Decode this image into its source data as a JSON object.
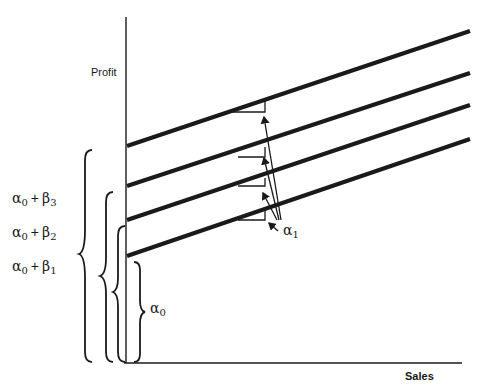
{
  "figure": {
    "x_axis_label": "Sales",
    "y_axis_label": "Profit",
    "colors": {
      "ink": "#1a1a1a",
      "background": "#ffffff"
    },
    "slope_label": {
      "symbol": "α",
      "sub": "1"
    },
    "intercept_labels": [
      {
        "id": "alpha0",
        "symbol": "α",
        "sub": "0",
        "text": "α0"
      },
      {
        "id": "b1",
        "a": "α",
        "a_sub": "0",
        "op": "+",
        "b": "β",
        "b_sub": "1"
      },
      {
        "id": "b2",
        "a": "α",
        "a_sub": "0",
        "op": "+",
        "b": "β",
        "b_sub": "2"
      },
      {
        "id": "b3",
        "a": "α",
        "a_sub": "0",
        "op": "+",
        "b": "β",
        "b_sub": "3"
      }
    ],
    "lines": [
      {
        "name": "baseline",
        "intercept": "α0",
        "slope": "α1",
        "x1": 127,
        "y1": 256,
        "x2": 470,
        "y2": 139
      },
      {
        "name": "group-1",
        "intercept": "α0 + β1",
        "slope": "α1",
        "x1": 127,
        "y1": 220,
        "x2": 470,
        "y2": 105
      },
      {
        "name": "group-2",
        "intercept": "α0 + β2",
        "slope": "α1",
        "x1": 127,
        "y1": 186,
        "x2": 470,
        "y2": 73
      },
      {
        "name": "group-3",
        "intercept": "α0 + β3",
        "slope": "α1",
        "x1": 127,
        "y1": 146,
        "x2": 470,
        "y2": 31
      }
    ]
  }
}
